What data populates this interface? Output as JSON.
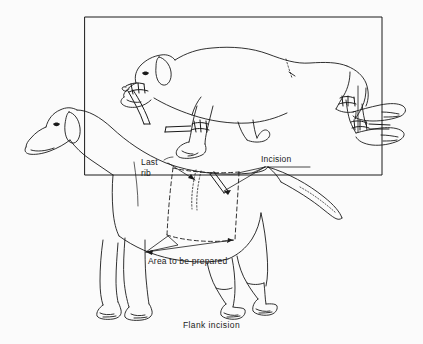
{
  "figure": {
    "title": "Flank incision",
    "domain_subject": "veterinary-surgical-line-drawing",
    "background_color": "#fbfbfb",
    "line_color": "#1a1a1a",
    "caption": "Flank incision"
  },
  "labels": {
    "last_rib_line1": "Last",
    "last_rib_line2": "rib",
    "incision": "Incision",
    "area_to_be_prepared": "Area to be prepared"
  },
  "panels": {
    "inset": {
      "name": "restraint-inset-box",
      "description": "rectangular frame enclosing dog in lateral recumbency",
      "x": 85,
      "y": 17,
      "width": 297,
      "height": 158
    },
    "main": {
      "name": "standing-dog-flank-view",
      "description": "standing dog shown in left lateral profile with surgical prep area"
    }
  },
  "annotations": [
    {
      "name": "last-rib-leader",
      "label": "Last rib",
      "target": "dotted rib outline on flank"
    },
    {
      "name": "incision-leader",
      "label": "Incision",
      "target": "double-line incision mark on flank"
    },
    {
      "name": "prep-area-leader",
      "label": "Area to be prepared",
      "target": "dashed quadrilateral over flank"
    }
  ],
  "restraint_details": [
    {
      "name": "muzzle-tie",
      "description": "rope tie around muzzle with trailing end"
    },
    {
      "name": "foreleg-tie",
      "description": "rope tie around foreleg pastern"
    },
    {
      "name": "hindleg-tie-upper",
      "description": "rope tie around upper hind pastern"
    },
    {
      "name": "hindleg-tie-lower",
      "description": "rope tie around lower hind pastern"
    }
  ]
}
